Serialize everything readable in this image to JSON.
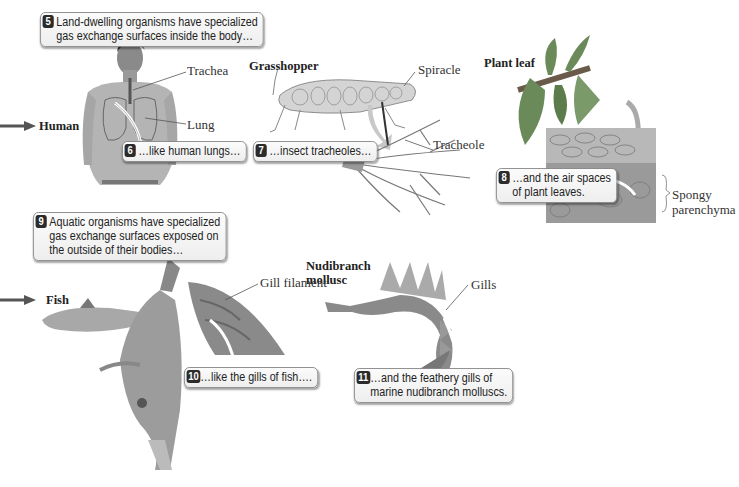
{
  "callouts": [
    {
      "number": "5",
      "lines": [
        "Land-dwelling organisms have specialized",
        "gas exchange surfaces inside the body…"
      ]
    },
    {
      "number": "6",
      "lines": [
        "…like human lungs…"
      ]
    },
    {
      "number": "7",
      "lines": [
        "…insect tracheoles…"
      ]
    },
    {
      "number": "8",
      "lines": [
        "…and the air spaces",
        "of plant leaves."
      ]
    },
    {
      "number": "9",
      "lines": [
        "Aquatic organisms have specialized",
        "gas exchange surfaces exposed on",
        "the outside of their bodies…"
      ]
    },
    {
      "number": "10",
      "lines": [
        "…like the gills of fish…."
      ]
    },
    {
      "number": "11",
      "lines": [
        "…and the feathery gills of",
        "marine nudibranch molluscs."
      ]
    }
  ],
  "organisms": {
    "human": "Human",
    "grasshopper": "Grasshopper",
    "plant_leaf": "Plant leaf",
    "fish": "Fish",
    "nudibranch": [
      "Nudibranch",
      "mollusc"
    ]
  },
  "structures": {
    "trachea": "Trachea",
    "lung": "Lung",
    "spiracle": "Spiracle",
    "tracheole": "Tracheole",
    "spongy_parenchyma": [
      "Spongy",
      "parenchyma"
    ],
    "gill_filament": "Gill filament",
    "gills": "Gills"
  },
  "colors": {
    "callout_number_bg": "#2b2b2b",
    "callout_border": "#8a8a8a",
    "arrow": "#555555"
  }
}
